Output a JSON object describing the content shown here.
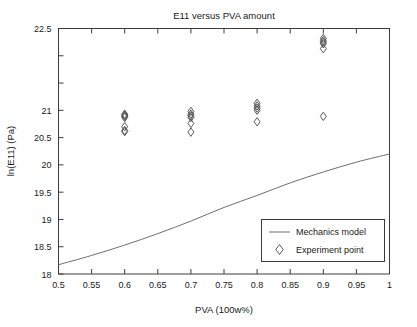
{
  "chart_data": {
    "type": "scatter",
    "title": "E11 versus PVA amount",
    "xlabel": "PVA (100w%)",
    "ylabel": "ln(E11) (Pa)",
    "xlim": [
      0.5,
      1.0
    ],
    "ylim": [
      18.0,
      22.5
    ],
    "xticks": [
      0.5,
      0.55,
      0.6,
      0.65,
      0.7,
      0.75,
      0.8,
      0.85,
      0.9,
      0.95,
      1
    ],
    "xtick_labels": [
      "0.5",
      "0.55",
      "0.6",
      "0.65",
      "0.7",
      "0.75",
      "0.8",
      "0.85",
      "0.9",
      "0.95",
      "1"
    ],
    "yticks": [
      18,
      18.5,
      19,
      19.5,
      20,
      20.5,
      21,
      21.5,
      22,
      22.5
    ],
    "ytick_labels": [
      "18",
      "18.5",
      "19",
      "19.5",
      "20",
      "20.5",
      "21",
      "21.5",
      "22",
      "22.5"
    ],
    "ytick_labels_shown": [
      "18",
      "18.5",
      "19",
      "19.5",
      "20",
      "20.5",
      "21",
      "22.5"
    ],
    "grid": false,
    "legend_position": "lower right",
    "series": [
      {
        "name": "Mechanics model",
        "type": "line",
        "marker": "none",
        "color": "#6e6e6e",
        "x": [
          0.5,
          0.55,
          0.6,
          0.65,
          0.7,
          0.75,
          0.8,
          0.85,
          0.9,
          0.95,
          1.0
        ],
        "y": [
          18.17,
          18.34,
          18.53,
          18.74,
          18.97,
          19.22,
          19.44,
          19.67,
          19.87,
          20.05,
          20.2
        ]
      },
      {
        "name": "Experiment point",
        "type": "scatter",
        "marker": "diamond",
        "color": "#4a4a4a",
        "points": [
          {
            "x": 0.6,
            "y": 20.93
          },
          {
            "x": 0.6,
            "y": 20.91
          },
          {
            "x": 0.6,
            "y": 20.89
          },
          {
            "x": 0.6,
            "y": 20.87
          },
          {
            "x": 0.6,
            "y": 20.7
          },
          {
            "x": 0.6,
            "y": 20.63
          },
          {
            "x": 0.6,
            "y": 20.61
          },
          {
            "x": 0.7,
            "y": 20.98
          },
          {
            "x": 0.7,
            "y": 20.93
          },
          {
            "x": 0.7,
            "y": 20.9
          },
          {
            "x": 0.7,
            "y": 20.87
          },
          {
            "x": 0.7,
            "y": 20.76
          },
          {
            "x": 0.7,
            "y": 20.6
          },
          {
            "x": 0.8,
            "y": 21.13
          },
          {
            "x": 0.8,
            "y": 21.08
          },
          {
            "x": 0.8,
            "y": 21.04
          },
          {
            "x": 0.8,
            "y": 21.0
          },
          {
            "x": 0.8,
            "y": 20.79
          },
          {
            "x": 0.9,
            "y": 22.32
          },
          {
            "x": 0.9,
            "y": 22.28
          },
          {
            "x": 0.9,
            "y": 22.25
          },
          {
            "x": 0.9,
            "y": 22.22
          },
          {
            "x": 0.9,
            "y": 22.13
          },
          {
            "x": 0.9,
            "y": 20.89
          }
        ]
      }
    ],
    "legend": [
      {
        "label": "Mechanics model",
        "marker": "line"
      },
      {
        "label": "Experiment point",
        "marker": "diamond"
      }
    ]
  }
}
